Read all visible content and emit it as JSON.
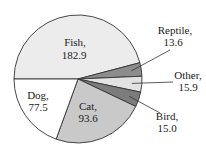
{
  "chart_data": {
    "type": "pie",
    "title": "",
    "start": "left, clockwise",
    "slices": [
      {
        "name": "Fish",
        "value": 182.9,
        "label_line1": "Fish,",
        "label_line2": "182.9",
        "color": "#ececec",
        "label_pos": "inside"
      },
      {
        "name": "Reptile",
        "value": 13.6,
        "label_line1": "Reptile,",
        "label_line2": "13.6",
        "color": "#8c8c8c",
        "label_pos": "outside"
      },
      {
        "name": "Other",
        "value": 15.9,
        "label_line1": "Other,",
        "label_line2": "15.9",
        "color": "#e2e2e2",
        "label_pos": "outside"
      },
      {
        "name": "Bird",
        "value": 15.0,
        "label_line1": "Bird,",
        "label_line2": "15.0",
        "color": "#7c7c7c",
        "label_pos": "outside"
      },
      {
        "name": "Cat",
        "value": 93.6,
        "label_line1": "Cat,",
        "label_line2": "93.6",
        "color": "#c9c9c9",
        "label_pos": "inside"
      },
      {
        "name": "Dog",
        "value": 77.5,
        "label_line1": "Dog,",
        "label_line2": "77.5",
        "color": "#ffffff",
        "label_pos": "inside"
      }
    ]
  }
}
